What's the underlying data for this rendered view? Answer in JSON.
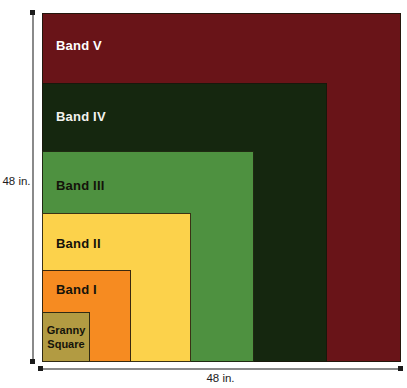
{
  "bands": [
    {
      "name": "Band V",
      "color": "#691418",
      "text_color": "#ffffff"
    },
    {
      "name": "Band IV",
      "color": "#15270f",
      "text_color": "#f2f2ee"
    },
    {
      "name": "Band III",
      "color": "#4e9140",
      "text_color": "#14130a"
    },
    {
      "name": "Band II",
      "color": "#fcd24b",
      "text_color": "#14130a"
    },
    {
      "name": "Band I",
      "color": "#f68b21",
      "text_color": "#14130a"
    },
    {
      "name": "Granny Square",
      "lines": [
        "Granny",
        "Square"
      ],
      "color": "#b29b42",
      "text_color": "#14130a"
    }
  ],
  "dimensions": {
    "height_label": "48 in.",
    "width_label": "48 in."
  },
  "arrow_color": "#1a1a1a"
}
